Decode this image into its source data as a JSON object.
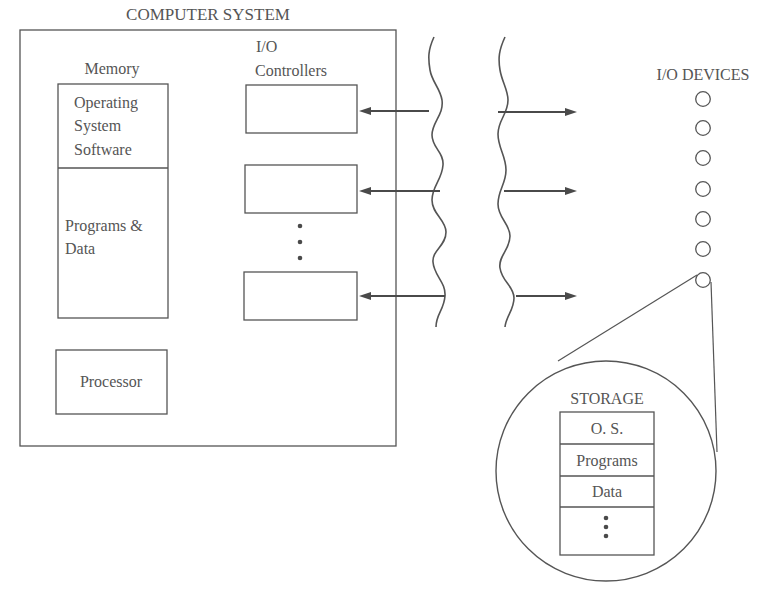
{
  "title": "COMPUTER SYSTEM",
  "memory": {
    "label": "Memory",
    "os_line1": "Operating",
    "os_line2": "System",
    "os_line3": "Software",
    "pd_line1": "Programs &",
    "pd_line2": "Data"
  },
  "processor": {
    "label": "Processor"
  },
  "io_controllers": {
    "label_line1": "I/O",
    "label_line2": "Controllers",
    "count_visible": 3,
    "ellipsis": "⋮"
  },
  "io_devices": {
    "label": "I/O DEVICES",
    "count_visible": 7
  },
  "storage": {
    "label": "STORAGE",
    "rows": [
      "O. S.",
      "Programs",
      "Data",
      "⋮"
    ]
  }
}
